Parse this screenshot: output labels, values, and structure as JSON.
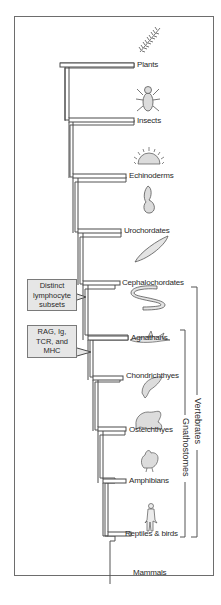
{
  "diagram": {
    "type": "phylogenetic-tree",
    "taxa": [
      {
        "label": "Plants",
        "icon": "fern-icon"
      },
      {
        "label": "Insects",
        "icon": "fly-icon"
      },
      {
        "label": "Echinoderms",
        "icon": "sea-urchin-icon"
      },
      {
        "label": "Urochordates",
        "icon": "sea-squirt-icon"
      },
      {
        "label": "Cephalochordates",
        "icon": "lancelet-icon"
      },
      {
        "label": "Agnathans",
        "icon": "lamprey-icon"
      },
      {
        "label": "Chondrichthyes",
        "icon": "shark-icon"
      },
      {
        "label": "Osteichthyes",
        "icon": "bony-fish-icon"
      },
      {
        "label": "Amphibians",
        "icon": "frog-icon"
      },
      {
        "label": "Reptiles & birds",
        "icon": "chicken-icon"
      },
      {
        "label": "Mammals",
        "icon": "human-icon"
      }
    ],
    "callouts": [
      {
        "lines": [
          "Distinct",
          "lymphocyte",
          "subsets"
        ]
      },
      {
        "lines": [
          "RAG, Ig,",
          "TCR, and",
          "MHC"
        ]
      }
    ],
    "brackets": [
      {
        "label": "Vertebrates"
      },
      {
        "label": "Gnathostomes"
      }
    ]
  }
}
